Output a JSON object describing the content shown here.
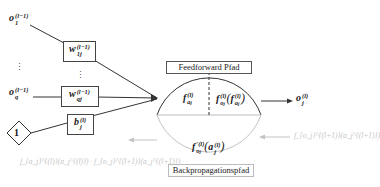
{
  "diagram": {
    "inputs": [
      {
        "id": "o1",
        "base": "o",
        "sub": "1",
        "sup": "(l−1)"
      },
      {
        "id": "oq",
        "base": "o",
        "sub": "q",
        "sup": "(l−1)"
      }
    ],
    "ellipsis_left": "⋮",
    "ellipsis_mid": "⋮",
    "weights": [
      {
        "id": "w1j",
        "base": "w",
        "sub": "1j",
        "sup": "(l−1)"
      },
      {
        "id": "wqj",
        "base": "w",
        "sub": "qj",
        "sup": "(l−1)"
      }
    ],
    "bias_input": {
      "label": "1"
    },
    "bias_weight": {
      "base": "b",
      "sub": "j",
      "sup": "(l)"
    },
    "feedforward_label": "Feedforward Pfad",
    "backprop_label": "Backpropagationspfad",
    "neuron": {
      "left_func": {
        "base": "f",
        "sub": "a",
        "subsub": "j",
        "sup": "(l)"
      },
      "right_func": "f_{o_j}^{(l)}(f_{a_j}^{(l)})",
      "right_func_parts": {
        "outer_base": "f",
        "outer_sub": "o",
        "outer_subsub": "j",
        "outer_sup": "(l)",
        "inner_base": "f",
        "inner_sub": "a",
        "inner_subsub": "j",
        "inner_sup": "(l)"
      },
      "bottom_func": "f'_{o_j}^{(l)}(a_j^{(l)})",
      "bottom_func_parts": {
        "base": "f",
        "prime": "′",
        "sub": "o",
        "subsub": "j",
        "sup": "(l)",
        "arg_base": "a",
        "arg_sub": "j",
        "arg_sup": "(l)"
      }
    },
    "output": {
      "base": "o",
      "sub": "j",
      "sup": "(l)"
    },
    "backprop_in": "f_{o_j}^{(l+1)}(a_j^{(l+1)})",
    "backprop_out": "f_{a_j}^{(l)}(a_j^{(l)}) · f_{o_j}^{(l+1)}(a_j^{(l+1)})",
    "colors": {
      "line": "#333333",
      "faded": "#c4c4c4",
      "divider": "#bdbdbd"
    }
  }
}
